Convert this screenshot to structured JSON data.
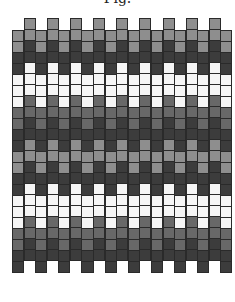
{
  "figure": {
    "title": "Fig."
  },
  "pattern": {
    "columns": 19,
    "cells_per_column": 22,
    "low_column_top_y": 30,
    "high_column_top_y": 18,
    "column_sequence": [
      "light",
      "light",
      "dark",
      "dark",
      "white",
      "white",
      "white",
      "mid",
      "mid",
      "dark",
      "dark",
      "light",
      "light",
      "dark",
      "dark",
      "white",
      "white",
      "white",
      "mid",
      "mid",
      "dark",
      "dark"
    ],
    "colors": {
      "light": "#8e8e8e",
      "mid": "#686868",
      "dark": "#3c3c3c",
      "white": "#f5f5f5",
      "border": "#2a2a2a"
    }
  }
}
